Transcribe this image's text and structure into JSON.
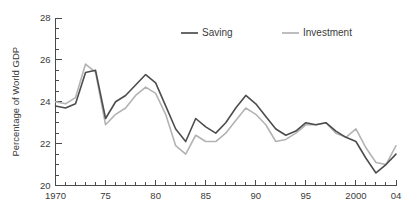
{
  "chart_data": {
    "type": "line",
    "title": "",
    "subtitle": "",
    "xlabel": "",
    "ylabel": "Percentage of World GDP",
    "xlim": [
      1970,
      2004
    ],
    "ylim": [
      20,
      28
    ],
    "grid": false,
    "legend_position": "top-center",
    "y_ticks": [
      20,
      22,
      24,
      26,
      28
    ],
    "y_tick_labels": [
      "20",
      "22",
      "24",
      "26",
      "28"
    ],
    "y_minor_step": 0.5,
    "x_ticks": [
      1970,
      1975,
      1980,
      1985,
      1990,
      1995,
      2000,
      2004
    ],
    "x_tick_labels": [
      "1970",
      "75",
      "80",
      "85",
      "90",
      "95",
      "2000",
      "04"
    ],
    "x_minor_step": 1,
    "x": [
      1970,
      1971,
      1972,
      1973,
      1974,
      1975,
      1976,
      1977,
      1978,
      1979,
      1980,
      1981,
      1982,
      1983,
      1984,
      1985,
      1986,
      1987,
      1988,
      1989,
      1990,
      1991,
      1992,
      1993,
      1994,
      1995,
      1996,
      1997,
      1998,
      1999,
      2000,
      2001,
      2002,
      2003,
      2004
    ],
    "series": [
      {
        "name": "Saving",
        "color": "#4d4d4d",
        "width": 1.6,
        "values": [
          23.8,
          23.7,
          23.9,
          25.4,
          25.5,
          23.2,
          24.0,
          24.3,
          24.8,
          25.3,
          24.9,
          23.8,
          22.7,
          22.1,
          23.2,
          22.8,
          22.5,
          23.0,
          23.7,
          24.3,
          23.9,
          23.3,
          22.7,
          22.4,
          22.6,
          23.0,
          22.9,
          23.0,
          22.6,
          22.3,
          22.1,
          21.3,
          20.6,
          21.0,
          21.5
        ]
      },
      {
        "name": "Investment",
        "color": "#b3b3b3",
        "width": 1.6,
        "values": [
          24.0,
          23.9,
          24.2,
          25.8,
          25.4,
          22.9,
          23.4,
          23.7,
          24.3,
          24.7,
          24.4,
          23.4,
          21.9,
          21.5,
          22.4,
          22.1,
          22.1,
          22.5,
          23.1,
          23.7,
          23.4,
          22.9,
          22.1,
          22.2,
          22.5,
          22.9,
          22.9,
          23.0,
          22.5,
          22.3,
          22.7,
          21.8,
          21.1,
          21.0,
          21.9
        ]
      }
    ],
    "legend": [
      {
        "label": "Saving",
        "color": "#4d4d4d"
      },
      {
        "label": "Investment",
        "color": "#b3b3b3"
      }
    ]
  },
  "axis": {
    "color": "#4a4a4a"
  }
}
